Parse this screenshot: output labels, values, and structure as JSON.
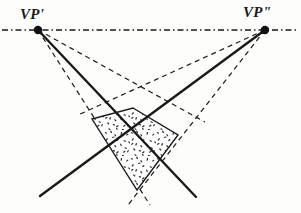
{
  "figure": {
    "background_color": "#fdfdfc",
    "ink_color": "#1a1a1a",
    "width": 301,
    "height": 213
  },
  "labels": {
    "vp_left": "VP'",
    "vp_right": "VP\""
  },
  "points": {
    "vp_left": {
      "x": 38,
      "y": 30
    },
    "vp_right": {
      "x": 265,
      "y": 30
    },
    "plane_top": {
      "x": 133,
      "y": 108
    },
    "plane_left": {
      "x": 92,
      "y": 119
    },
    "plane_right": {
      "x": 178,
      "y": 135
    },
    "plane_bottom": {
      "x": 137,
      "y": 190
    },
    "solid_left_end": {
      "x": 40,
      "y": 196
    },
    "solid_right_end": {
      "x": 196,
      "y": 197
    },
    "center_cross": {
      "x": 137,
      "y": 141
    }
  },
  "horizon": {
    "name": "horizon-line",
    "style": "dash-dot",
    "y": 30,
    "x_start": 2,
    "x_end": 299,
    "color": "#1a1a1a"
  },
  "solid_rays": [
    {
      "name": "ray-vp-left-to-lower-right",
      "from": "vp_left",
      "to": "solid_right_end"
    },
    {
      "name": "ray-vp-right-to-lower-left",
      "from": "vp_right",
      "to": "solid_left_end"
    }
  ],
  "dashed_rays": [
    {
      "name": "dashed-vp-left-upper",
      "from": "vp_left",
      "to": "plane_right"
    },
    {
      "name": "dashed-vp-left-lower",
      "from": "vp_left",
      "to": "plane_bottom"
    },
    {
      "name": "dashed-vp-right-upper",
      "from": "vp_right",
      "to": "plane_left"
    },
    {
      "name": "dashed-vp-right-lower",
      "from": "vp_right",
      "to": "plane_bottom"
    }
  ],
  "plane": {
    "name": "stippled-quadrilateral",
    "fill": "stipple-texture",
    "vertices": [
      "plane_top",
      "plane_right",
      "plane_bottom",
      "plane_left"
    ],
    "outline_color": "#1a1a1a"
  }
}
